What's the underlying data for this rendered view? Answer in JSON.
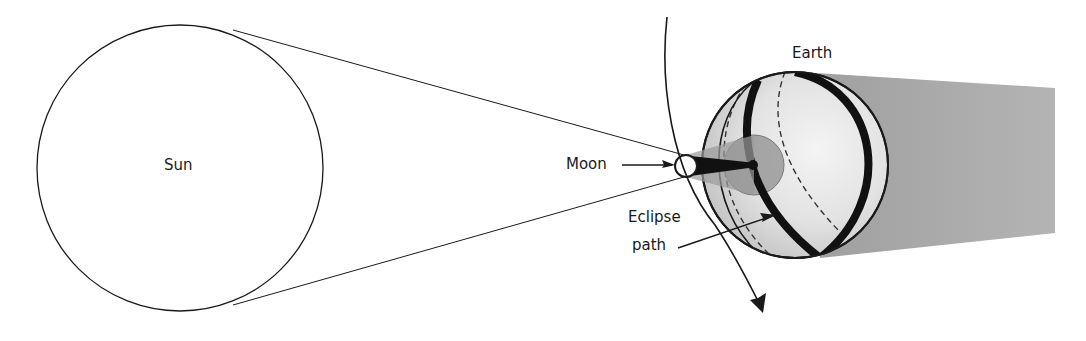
{
  "diagram": {
    "type": "solar-eclipse-geometry",
    "labels": {
      "sun": "Sun",
      "moon": "Moon",
      "earth": "Earth",
      "eclipse_path_line1": "Eclipse",
      "eclipse_path_line2": "path"
    },
    "colors": {
      "background": "#ffffff",
      "outline": "#1a1a1a",
      "earth_fill": "#dcdcdc",
      "earth_highlight": "#f2f2f2",
      "shadow_trail": "#a9a9a9",
      "penumbra": "#9a9a9a",
      "umbra": "#111111",
      "eclipse_band": "#111111"
    },
    "elements": [
      {
        "name": "Sun",
        "shape": "circle",
        "cx": 180,
        "cy": 168,
        "r": 143
      },
      {
        "name": "Moon",
        "shape": "circle",
        "cx": 686,
        "cy": 166,
        "r": 11
      },
      {
        "name": "Earth",
        "shape": "sphere",
        "cx": 795,
        "cy": 165,
        "r": 93
      },
      {
        "name": "Earth orbit arc",
        "shape": "arrow-arc",
        "start": [
          667,
          17
        ],
        "end": [
          763,
          312
        ]
      },
      {
        "name": "Penumbra on Earth",
        "shape": "circle",
        "cx": 754,
        "cy": 165,
        "r": 30
      },
      {
        "name": "Earth night-side shadow",
        "shape": "band",
        "to_x": 1055
      }
    ]
  }
}
